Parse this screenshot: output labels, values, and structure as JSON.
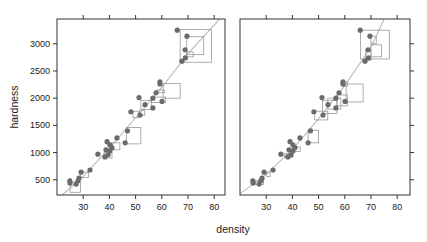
{
  "chart_data": {
    "type": "scatter",
    "layout": "two panels side by side, shared y-axis",
    "xlabel": "density",
    "ylabel": "hardness",
    "x_ticks": [
      30,
      40,
      50,
      60,
      70,
      80
    ],
    "y_ticks": [
      500,
      1000,
      1500,
      2000,
      2500,
      3000
    ],
    "y_tick_labels": [
      "500",
      "1000",
      "1500",
      "2000",
      "2500",
      "3000"
    ],
    "xlim": [
      20,
      85
    ],
    "ylim": [
      220,
      3450
    ],
    "grid": false,
    "legend": null,
    "colors": {
      "points": "#6b6b6b",
      "boxes": "#999999",
      "curve": "#bbbbbb",
      "axis": "#333333"
    },
    "points": [
      [
        24.9,
        480
      ],
      [
        25.0,
        440
      ],
      [
        27.3,
        420
      ],
      [
        28.0,
        480
      ],
      [
        28.4,
        530
      ],
      [
        29.2,
        640
      ],
      [
        32.6,
        680
      ],
      [
        35.6,
        970
      ],
      [
        38.3,
        920
      ],
      [
        38.7,
        1050
      ],
      [
        39.5,
        960
      ],
      [
        40.2,
        1030
      ],
      [
        41.0,
        1090
      ],
      [
        40.2,
        1140
      ],
      [
        39.1,
        1200
      ],
      [
        42.9,
        1270
      ],
      [
        46.0,
        1180
      ],
      [
        46.9,
        1400
      ],
      [
        48.2,
        1750
      ],
      [
        51.7,
        1690
      ],
      [
        51.3,
        2010
      ],
      [
        53.6,
        1880
      ],
      [
        56.6,
        1820
      ],
      [
        56.6,
        2000
      ],
      [
        57.8,
        2100
      ],
      [
        60.1,
        1940
      ],
      [
        59.3,
        2260
      ],
      [
        59.3,
        2300
      ],
      [
        65.9,
        3250
      ],
      [
        69.6,
        3140
      ],
      [
        68.9,
        2890
      ],
      [
        69.0,
        2740
      ],
      [
        67.7,
        2680
      ]
    ],
    "panels": [
      {
        "name": "left",
        "curve": [
          [
            22,
            220
          ],
          [
            30,
            560
          ],
          [
            40,
            1080
          ],
          [
            50,
            1640
          ],
          [
            60,
            2200
          ],
          [
            70,
            2820
          ],
          [
            82,
            3450
          ]
        ],
        "boxes": [
          [
            25,
            270,
            29,
            460
          ],
          [
            29,
            540,
            32,
            640
          ],
          [
            38,
            900,
            41,
            1010
          ],
          [
            41,
            1050,
            44,
            1180
          ],
          [
            46.5,
            1160,
            52,
            1460
          ],
          [
            49,
            1640,
            51,
            1760
          ],
          [
            51.5,
            1680,
            53.5,
            1770
          ],
          [
            52,
            1790,
            56,
            1960
          ],
          [
            56,
            1920,
            61.5,
            2020
          ],
          [
            58,
            2100,
            61,
            2150
          ],
          [
            60.5,
            2000,
            67,
            2270
          ],
          [
            67,
            2660,
            79,
            3260
          ],
          [
            69.5,
            2800,
            76,
            3130
          ],
          [
            69.5,
            2760,
            72,
            2850
          ]
        ]
      },
      {
        "name": "right",
        "curve": [
          [
            20,
            240
          ],
          [
            30,
            600
          ],
          [
            40,
            1060
          ],
          [
            50,
            1620
          ],
          [
            60,
            2230
          ],
          [
            70,
            2940
          ],
          [
            75,
            3450
          ]
        ],
        "boxes": [
          [
            26,
            410,
            29,
            480
          ],
          [
            30,
            560,
            31.5,
            640
          ],
          [
            37,
            910,
            40,
            980
          ],
          [
            40.5,
            1020,
            43,
            1100
          ],
          [
            46,
            1180,
            50,
            1410
          ],
          [
            48.5,
            1600,
            53.5,
            1760
          ],
          [
            51.5,
            1720,
            57,
            1960
          ],
          [
            53.5,
            1800,
            58.5,
            2000
          ],
          [
            57,
            1860,
            61,
            2060
          ],
          [
            59,
            2220,
            61,
            2300
          ],
          [
            60.5,
            1930,
            67,
            2260
          ],
          [
            66,
            2720,
            77,
            3250
          ],
          [
            70,
            3000,
            72,
            3140
          ],
          [
            70,
            2760,
            74,
            2980
          ],
          [
            68,
            2700,
            70,
            2880
          ]
        ]
      }
    ]
  }
}
